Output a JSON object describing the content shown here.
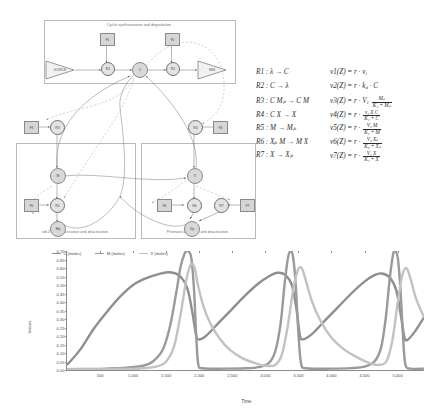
{
  "diagram": {
    "panels": [
      {
        "id": "cyclin",
        "title": "Cyclin synthesization and degradation"
      },
      {
        "id": "cdc2",
        "title": "cdc2 kinase activation and deactivation"
      },
      {
        "id": "protease",
        "title": "Protease activation and deactivation"
      }
    ],
    "places": [
      {
        "id": "C",
        "label": "C"
      },
      {
        "id": "M",
        "label": "M"
      },
      {
        "id": "X",
        "label": "X"
      },
      {
        "id": "Mp",
        "label": "Mp"
      },
      {
        "id": "Xp",
        "label": "Xp"
      }
    ],
    "transitions": [
      {
        "id": "R1",
        "label": "R1"
      },
      {
        "id": "R2",
        "label": "R2"
      },
      {
        "id": "R3",
        "label": "R3"
      },
      {
        "id": "R4",
        "label": "R4"
      },
      {
        "id": "R5",
        "label": "R5"
      },
      {
        "id": "R6",
        "label": "R6"
      },
      {
        "id": "R7",
        "label": "R7"
      }
    ],
    "factors": [
      {
        "id": "F1",
        "label": "F1"
      },
      {
        "id": "F2",
        "label": "F2"
      },
      {
        "id": "F3",
        "label": "F3"
      },
      {
        "id": "F4",
        "label": "F4"
      },
      {
        "id": "F5",
        "label": "F5"
      },
      {
        "id": "F6",
        "label": "F6"
      },
      {
        "id": "F7",
        "label": "F7"
      }
    ],
    "terminals": [
      {
        "id": "source",
        "label": "SOURCE"
      },
      {
        "id": "sink",
        "label": "SINK"
      }
    ]
  },
  "equations": [
    {
      "id": "R1",
      "lhs": "R1 : λ → C",
      "rate_name": "v1(Z) = r ·",
      "rate_tail": "v",
      "rate_tail_sub": "i",
      "frac": null
    },
    {
      "id": "R2",
      "lhs": "R2 : C → λ",
      "rate_name": "v2(Z) = r ·",
      "rate_tail": "k",
      "rate_tail_sub": "d",
      "rate_tail2": " · C",
      "frac": null
    },
    {
      "id": "R3",
      "lhs": "R3 : C Mₚ → C M",
      "rate_name": "v3(Z) = r ·",
      "rate_tail": "V",
      "rate_tail_sub": "1",
      "frac": {
        "num": "Mₚ",
        "den": "K₄ + Mₚ"
      }
    },
    {
      "id": "R4",
      "lhs": "R4 : C X → X",
      "rate_name": "v4(Z) = r ·",
      "rate_tail": "",
      "frac": {
        "num": "v₄ X C",
        "den": "K₄ + C"
      }
    },
    {
      "id": "R5",
      "lhs": "R5 : M → Mₚ",
      "rate_name": "v5(Z) = r ·",
      "rate_tail": "",
      "frac": {
        "num": "V₂ M",
        "den": "K₂ + M"
      }
    },
    {
      "id": "R6",
      "lhs": "R6 : Xₚ M → M X",
      "rate_name": "v6(Z) = r ·",
      "rate_tail": "",
      "frac": {
        "num": "V₃ Xₚ",
        "den": "K₃ + Xₚ"
      }
    },
    {
      "id": "R7",
      "lhs": "R7 : X → Xₚ",
      "rate_name": "v7(Z) = r ·",
      "rate_tail": "",
      "frac": {
        "num": "V₄ X",
        "den": "K₄ + X"
      }
    }
  ],
  "chart_data": {
    "type": "line",
    "title": "",
    "xlabel": "Time",
    "ylabel": "Values",
    "xlim": [
      0,
      5400
    ],
    "ylim": [
      0,
      0.7
    ],
    "grid": false,
    "legend_position": "top-left",
    "xticks": [
      "500",
      "1,000",
      "1,500",
      "2,000",
      "2,500",
      "3,000",
      "3,500",
      "4,000",
      "4,500",
      "5,000"
    ],
    "xtick_values": [
      500,
      1000,
      1500,
      2000,
      2500,
      3000,
      3500,
      4000,
      4500,
      5000
    ],
    "yticks": [
      "0.00",
      "0.05",
      "0.10",
      "0.15",
      "0.20",
      "0.25",
      "0.30",
      "0.35",
      "0.40",
      "0.45",
      "0.50",
      "0.55",
      "0.60",
      "0.65",
      "0.70"
    ],
    "ytick_values": [
      0,
      0.05,
      0.1,
      0.15,
      0.2,
      0.25,
      0.3,
      0.35,
      0.4,
      0.45,
      0.5,
      0.55,
      0.6,
      0.65,
      0.7
    ],
    "series": [
      {
        "name": "C (moles)",
        "color": "#8f8f8f",
        "points": [
          [
            0,
            0.03
          ],
          [
            200,
            0.12
          ],
          [
            400,
            0.24
          ],
          [
            600,
            0.34
          ],
          [
            800,
            0.43
          ],
          [
            1000,
            0.5
          ],
          [
            1200,
            0.54
          ],
          [
            1400,
            0.565
          ],
          [
            1550,
            0.575
          ],
          [
            1700,
            0.555
          ],
          [
            1820,
            0.48
          ],
          [
            1900,
            0.33
          ],
          [
            1950,
            0.21
          ],
          [
            1990,
            0.18
          ],
          [
            2100,
            0.2
          ],
          [
            2300,
            0.28
          ],
          [
            2500,
            0.36
          ],
          [
            2700,
            0.44
          ],
          [
            2900,
            0.51
          ],
          [
            3050,
            0.55
          ],
          [
            3180,
            0.572
          ],
          [
            3300,
            0.56
          ],
          [
            3400,
            0.5
          ],
          [
            3470,
            0.36
          ],
          [
            3520,
            0.21
          ],
          [
            3560,
            0.18
          ],
          [
            3700,
            0.21
          ],
          [
            3900,
            0.29
          ],
          [
            4100,
            0.37
          ],
          [
            4300,
            0.45
          ],
          [
            4500,
            0.52
          ],
          [
            4650,
            0.558
          ],
          [
            4760,
            0.568
          ],
          [
            4880,
            0.545
          ],
          [
            4980,
            0.47
          ],
          [
            5050,
            0.32
          ],
          [
            5100,
            0.2
          ],
          [
            5140,
            0.175
          ],
          [
            5250,
            0.22
          ],
          [
            5400,
            0.31
          ]
        ]
      },
      {
        "name": "M (moles)",
        "color": "#9a9a9a",
        "points": [
          [
            0,
            0.005
          ],
          [
            300,
            0.006
          ],
          [
            600,
            0.008
          ],
          [
            900,
            0.013
          ],
          [
            1150,
            0.025
          ],
          [
            1300,
            0.05
          ],
          [
            1450,
            0.12
          ],
          [
            1560,
            0.26
          ],
          [
            1650,
            0.45
          ],
          [
            1720,
            0.61
          ],
          [
            1780,
            0.685
          ],
          [
            1830,
            0.7
          ],
          [
            1880,
            0.66
          ],
          [
            1920,
            0.48
          ],
          [
            1955,
            0.2
          ],
          [
            1985,
            0.035
          ],
          [
            2050,
            0.01
          ],
          [
            2400,
            0.008
          ],
          [
            2700,
            0.01
          ],
          [
            2900,
            0.017
          ],
          [
            3050,
            0.04
          ],
          [
            3150,
            0.11
          ],
          [
            3230,
            0.27
          ],
          [
            3290,
            0.5
          ],
          [
            3340,
            0.655
          ],
          [
            3380,
            0.7
          ],
          [
            3420,
            0.665
          ],
          [
            3460,
            0.5
          ],
          [
            3500,
            0.22
          ],
          [
            3540,
            0.04
          ],
          [
            3620,
            0.01
          ],
          [
            4000,
            0.008
          ],
          [
            4300,
            0.011
          ],
          [
            4500,
            0.02
          ],
          [
            4650,
            0.05
          ],
          [
            4750,
            0.13
          ],
          [
            4820,
            0.3
          ],
          [
            4880,
            0.53
          ],
          [
            4930,
            0.675
          ],
          [
            4965,
            0.7
          ],
          [
            5005,
            0.655
          ],
          [
            5045,
            0.47
          ],
          [
            5085,
            0.18
          ],
          [
            5120,
            0.03
          ],
          [
            5200,
            0.008
          ],
          [
            5400,
            0.008
          ]
        ]
      },
      {
        "name": "X (moles)",
        "color": "#c2c2c2",
        "points": [
          [
            0,
            0.004
          ],
          [
            400,
            0.005
          ],
          [
            800,
            0.006
          ],
          [
            1100,
            0.009
          ],
          [
            1350,
            0.02
          ],
          [
            1500,
            0.05
          ],
          [
            1620,
            0.14
          ],
          [
            1720,
            0.33
          ],
          [
            1800,
            0.52
          ],
          [
            1870,
            0.62
          ],
          [
            1930,
            0.6
          ],
          [
            1980,
            0.5
          ],
          [
            2060,
            0.38
          ],
          [
            2160,
            0.28
          ],
          [
            2300,
            0.19
          ],
          [
            2460,
            0.12
          ],
          [
            2650,
            0.07
          ],
          [
            2850,
            0.04
          ],
          [
            3000,
            0.025
          ],
          [
            3150,
            0.03
          ],
          [
            3250,
            0.09
          ],
          [
            3340,
            0.26
          ],
          [
            3420,
            0.47
          ],
          [
            3490,
            0.585
          ],
          [
            3550,
            0.6
          ],
          [
            3610,
            0.53
          ],
          [
            3700,
            0.41
          ],
          [
            3820,
            0.3
          ],
          [
            3980,
            0.2
          ],
          [
            4160,
            0.13
          ],
          [
            4360,
            0.08
          ],
          [
            4550,
            0.045
          ],
          [
            4700,
            0.03
          ],
          [
            4830,
            0.05
          ],
          [
            4920,
            0.17
          ],
          [
            5000,
            0.39
          ],
          [
            5070,
            0.555
          ],
          [
            5130,
            0.6
          ],
          [
            5190,
            0.545
          ],
          [
            5280,
            0.42
          ],
          [
            5400,
            0.31
          ]
        ]
      }
    ]
  }
}
